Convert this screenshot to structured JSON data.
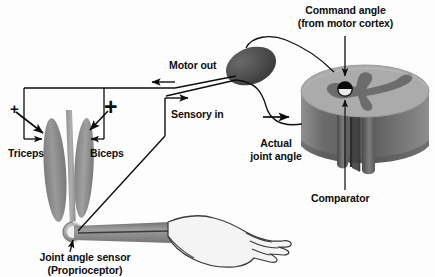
{
  "figure": {
    "background_color": "#fdfdfd",
    "ink_color": "#0d0d0d"
  },
  "labels": {
    "command_angle_line1": "Command angle",
    "command_angle_line2": "(from motor cortex)",
    "motor_out": "Motor out",
    "sensory_in": "Sensory in",
    "actual_joint_angle_line1": "Actual",
    "actual_joint_angle_line2": "joint angle",
    "comparator": "Comparator",
    "triceps": "Triceps",
    "biceps": "Biceps",
    "joint_sensor_line1": "Joint angle sensor",
    "joint_sensor_line2": "(Proprioceptor)",
    "plus_left": "+",
    "plus_right": "+"
  },
  "parts": {
    "triceps_muscle": "triceps-muscle",
    "biceps_muscle": "biceps-muscle",
    "humerus_bone": "humerus-bone",
    "forearm": "forearm",
    "hand": "hand",
    "joint_sensor_node": "joint-angle-sensor",
    "ganglion": "spinal-ganglion",
    "cylinder": "spinal-cord-cylinder",
    "comparator_node": "comparator-node"
  },
  "colors": {
    "muscle_fill": "#8a8a8a",
    "muscle_fill_light": "#9d9d9d",
    "bone_fill": "#9b9b9b",
    "forearm_fill": "#8e8e8e",
    "hand_fill": "#f3f3f3",
    "ganglion_fill": "#4a4a4a",
    "cylinder_top": "#a8a8a8",
    "cylinder_groove": "#6e6e6e",
    "cylinder_side_light": "#9a9a9a",
    "cylinder_side_dark": "#5d5d5d",
    "comparator_black": "#0a0a0a"
  }
}
